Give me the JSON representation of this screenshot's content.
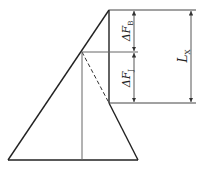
{
  "diagram": {
    "labels": {
      "dF_B": {
        "prefix": "ΔF",
        "sub": "B"
      },
      "dF_J": {
        "prefix": "ΔF",
        "sub": "J"
      },
      "L_X": {
        "prefix": "L",
        "sub": "X"
      }
    },
    "colors": {
      "stroke": "#222222",
      "thin": "#555555"
    }
  }
}
